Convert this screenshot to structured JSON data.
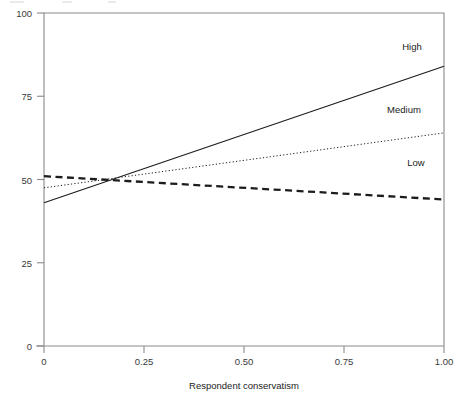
{
  "chart_data": {
    "type": "line",
    "title": "",
    "subtitle": "",
    "xlabel": "Respondent conservatism",
    "ylabel": "",
    "xlim": [
      0,
      1.0
    ],
    "ylim": [
      0,
      100
    ],
    "grid": false,
    "legend_position": "inline-right-of-lines",
    "x_ticks": [
      0,
      0.25,
      0.5,
      0.75,
      1.0
    ],
    "x_tick_labels": [
      "0",
      "0.25",
      "0.50",
      "0.75",
      "1.00"
    ],
    "y_ticks": [
      0,
      25,
      50,
      75,
      100
    ],
    "y_tick_labels": [
      "0",
      "25",
      "50",
      "75",
      "100"
    ],
    "x": [
      0,
      1.0
    ],
    "series": [
      {
        "name": "High",
        "label": "High",
        "style": "solid",
        "color": "#1c1c1c",
        "values": [
          43,
          84
        ]
      },
      {
        "name": "Medium",
        "label": "Medium",
        "style": "dotted",
        "color": "#1c1c1c",
        "values": [
          47.5,
          64
        ]
      },
      {
        "name": "Low",
        "label": "Low",
        "style": "dashed",
        "color": "#1c1c1c",
        "values": [
          51,
          44
        ]
      }
    ],
    "annotations": [
      {
        "text": "High",
        "x": 0.92,
        "y": 89
      },
      {
        "text": "Medium",
        "x": 0.9,
        "y": 70
      },
      {
        "text": "Low",
        "x": 0.93,
        "y": 54
      }
    ]
  },
  "axes": {
    "x_title": "Respondent conservatism",
    "x_tick_labels": [
      "0",
      "0.25",
      "0.50",
      "0.75",
      "1.00"
    ],
    "y_tick_labels": [
      "100",
      "75",
      "50",
      "25",
      "0"
    ]
  },
  "series_labels": {
    "high": "High",
    "medium": "Medium",
    "low": "Low"
  }
}
